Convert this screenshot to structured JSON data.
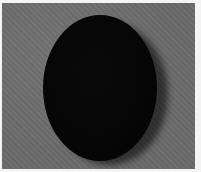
{
  "image": {
    "description": "Grayscale photo of a dark oval object on a gray textured surface",
    "colors": {
      "background": "#6a6a6a",
      "object": "#050505",
      "border": "#f4f4f4"
    }
  }
}
